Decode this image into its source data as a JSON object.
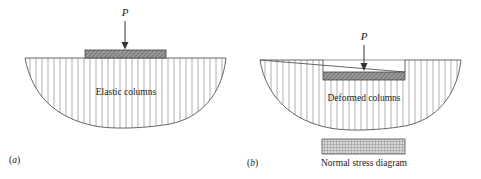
{
  "figure": {
    "panel_a": {
      "label": "(a)",
      "label_letter": "a",
      "load_label": "P",
      "region_label": "Elastic columns"
    },
    "panel_b": {
      "label": "(b)",
      "label_letter": "b",
      "load_label": "P",
      "region_label": "Deformed columns",
      "stress_label": "Normal stress diagram"
    },
    "colors": {
      "line": "#555555",
      "hatch_fill": "#8a8a8a",
      "column_line": "#888888",
      "text": "#222222"
    }
  }
}
